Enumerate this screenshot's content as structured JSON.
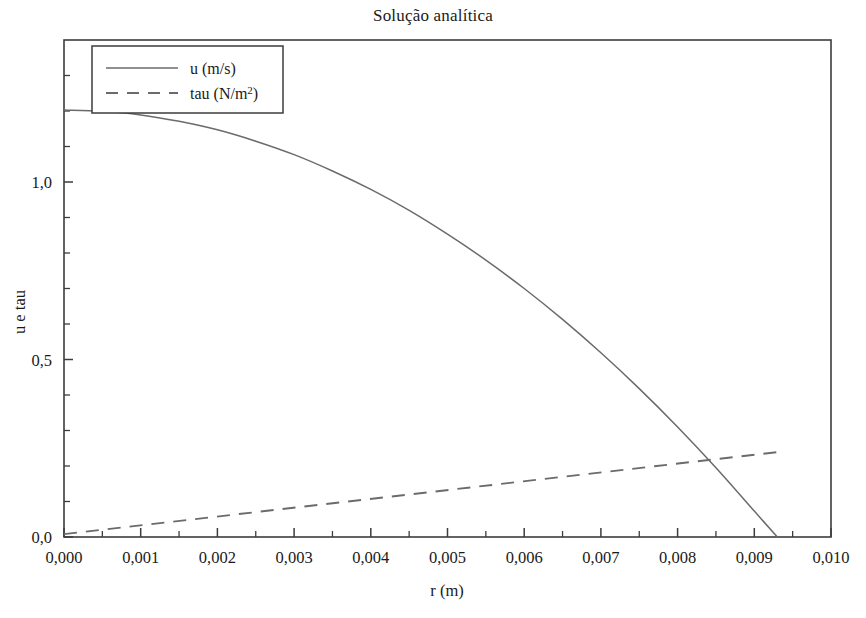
{
  "chart_data": {
    "type": "line",
    "title": "Solução analítica",
    "xlabel": "r (m)",
    "ylabel": "u e tau",
    "xlim": [
      0.0,
      0.01
    ],
    "ylim": [
      0.0,
      1.4
    ],
    "grid": false,
    "legend_position": "top-left-inside",
    "x_tick_labels": [
      "0,000",
      "0,001",
      "0,002",
      "0,003",
      "0,004",
      "0,005",
      "0,006",
      "0,007",
      "0,008",
      "0,009",
      "0,010"
    ],
    "x_tick_values": [
      0.0,
      0.001,
      0.002,
      0.003,
      0.004,
      0.005,
      0.006,
      0.007,
      0.008,
      0.009,
      0.01
    ],
    "x_minor_per_interval": 1,
    "y_tick_labels": [
      "0,0",
      "0,5",
      "1,0"
    ],
    "y_tick_values": [
      0.0,
      0.5,
      1.0
    ],
    "y_minor_step": 0.1,
    "series": [
      {
        "name": "u (m/s)",
        "style": "solid",
        "color": "#6b6b6b",
        "x": [
          0.0,
          0.0005,
          0.001,
          0.0015,
          0.002,
          0.0025,
          0.003,
          0.0035,
          0.004,
          0.0045,
          0.005,
          0.0055,
          0.006,
          0.0065,
          0.007,
          0.0075,
          0.008,
          0.0085,
          0.009,
          0.0093
        ],
        "values": [
          1.203,
          1.199,
          1.189,
          1.171,
          1.147,
          1.115,
          1.077,
          1.031,
          0.979,
          0.92,
          0.853,
          0.78,
          0.7,
          0.613,
          0.519,
          0.418,
          0.31,
          0.195,
          0.073,
          0.0
        ]
      },
      {
        "name": "tau (N/m²)",
        "style": "dashed",
        "color": "#6b6b6b",
        "x": [
          0.0,
          0.0093
        ],
        "values": [
          0.008,
          0.239
        ]
      }
    ]
  },
  "legend": {
    "entries": [
      {
        "label": "u (m/s)",
        "style": "solid"
      },
      {
        "label": "tau (N/m",
        "superscript": "2",
        "suffix": ")",
        "style": "dashed"
      }
    ],
    "tau_label_main": "tau (N/m",
    "tau_label_sup": "2",
    "tau_label_end": ")"
  }
}
